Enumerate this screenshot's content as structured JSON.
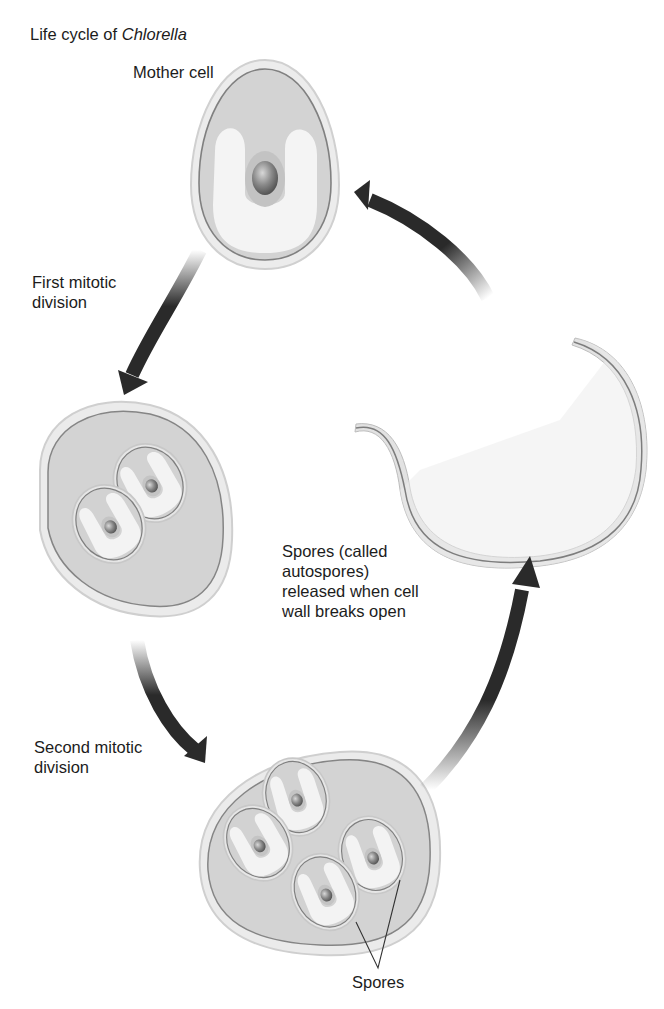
{
  "diagram": {
    "title_prefix": "Life cycle of ",
    "title_organism": "Chlorella",
    "labels": {
      "mother_cell": "Mother cell",
      "first_division_line1": "First mitotic",
      "first_division_line2": "division",
      "second_division_line1": "Second mitotic",
      "second_division_line2": "division",
      "release_line1": "Spores (called",
      "release_line2": "autospores)",
      "release_line3": "released when cell",
      "release_line4": "wall breaks open",
      "spores": "Spores"
    },
    "stages": [
      {
        "id": "mother-cell",
        "spore_count": 1
      },
      {
        "id": "first-mitotic-division",
        "spore_count": 2
      },
      {
        "id": "second-mitotic-division",
        "spore_count": 4
      },
      {
        "id": "spore-release",
        "spore_count": 4
      }
    ],
    "colors": {
      "cell_wall_outer": "#e9e9e9",
      "cytoplasm": "#d4d4d4",
      "membrane_line": "#8a8a8a",
      "chloroplast": "#f2f2f2",
      "nucleus": "#7d7d7d",
      "arrow": "#2a2a2a"
    }
  }
}
